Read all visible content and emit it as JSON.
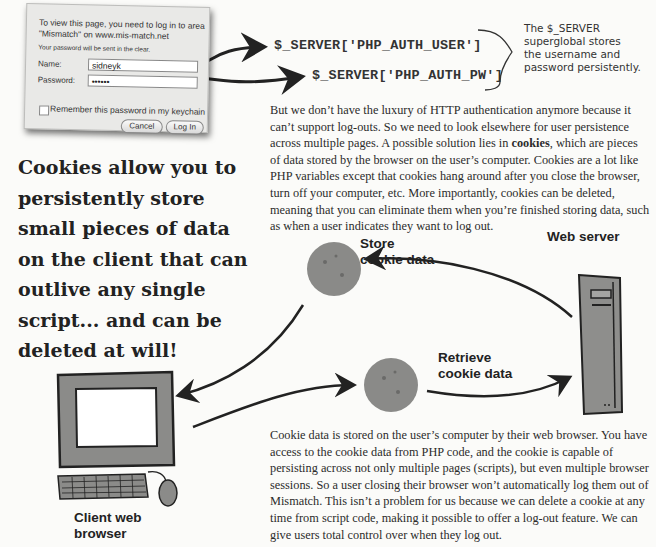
{
  "login_dialog": {
    "message": "To view this page, you need to log in to area \"Mismatch\" on www.mis-match.net",
    "warning": "Your password will be sent in the clear.",
    "name_label": "Name:",
    "name_value": "sidneyk",
    "password_label": "Password:",
    "password_value": "••••••",
    "remember_label": "Remember this password in my keychain",
    "cancel_label": "Cancel",
    "login_label": "Log In"
  },
  "code_refs": {
    "user": "$_SERVER['PHP_AUTH_USER']",
    "password": "$_SERVER['PHP_AUTH_PW']"
  },
  "annotation": {
    "lines": [
      "The $_SERVER",
      "superglobal stores",
      "the username and",
      "password persistently."
    ]
  },
  "paragraph_1": {
    "before_bold": "But we don’t have the luxury of HTTP authentication anymore because it can’t support log-outs. So we need to look elsewhere for user persistence across multiple pages. A possible solution lies in ",
    "bold": "cookies",
    "after_bold": ", which are pieces of data stored by the browser on the user’s computer. Cookies are a lot like PHP variables except that cookies hang around after you close the browser, turn off your computer, etc. More importantly, cookies can be deleted, meaning that you can eliminate them when you’re finished storing data, such as when a user indicates they want to log out."
  },
  "callout": "Cookies allow you to persistently store small pieces of data on the client that can outlive any single script... and can be deleted at will!",
  "diagram": {
    "server_label": "Web server",
    "client_label_1": "Client web",
    "client_label_2": "browser",
    "store_label_1": "Store",
    "store_label_2": "cookie data",
    "retrieve_label_1": "Retrieve",
    "retrieve_label_2": "cookie data"
  },
  "paragraph_2": "Cookie data is stored on the user’s computer by their web browser. You have access to the cookie data from PHP code, and the cookie is capable of persisting across not only multiple pages (scripts), but even multiple browser sessions. So a user closing their browser won’t automatically log them out of Mismatch. This isn’t a problem for us because we can delete a cookie at any time from script code, making it possible to offer a log-out feature. We can give users total control over when they log out."
}
